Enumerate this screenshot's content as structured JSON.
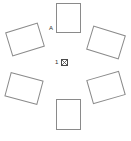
{
  "diagram": {
    "background_color": "#ffffff",
    "stroke_color": "#8a8a8a",
    "text_color": "#2b2b2b",
    "panels": [
      {
        "id": "panel-top",
        "label": "",
        "x": 56,
        "y": 3,
        "width": 25,
        "height": 30,
        "rotation": 0
      },
      {
        "id": "panel-upper-left",
        "label": "",
        "x": 8,
        "y": 27,
        "width": 34,
        "height": 25,
        "rotation": -17
      },
      {
        "id": "panel-upper-right",
        "label": "",
        "x": 89,
        "y": 30,
        "width": 34,
        "height": 25,
        "rotation": 17
      },
      {
        "id": "panel-lower-left",
        "label": "",
        "x": 7,
        "y": 76,
        "width": 34,
        "height": 25,
        "rotation": 15
      },
      {
        "id": "panel-lower-right",
        "label": "",
        "x": 89,
        "y": 75,
        "width": 34,
        "height": 25,
        "rotation": -16
      },
      {
        "id": "panel-bottom",
        "label": "",
        "x": 56,
        "y": 99,
        "width": 25,
        "height": 31,
        "rotation": 0
      }
    ],
    "annotations": {
      "panel_letter": "A",
      "panel_letter_x": 49,
      "panel_letter_y": 25
    },
    "center": {
      "number": "1",
      "marker_icon": "hatched-square-marker"
    }
  }
}
